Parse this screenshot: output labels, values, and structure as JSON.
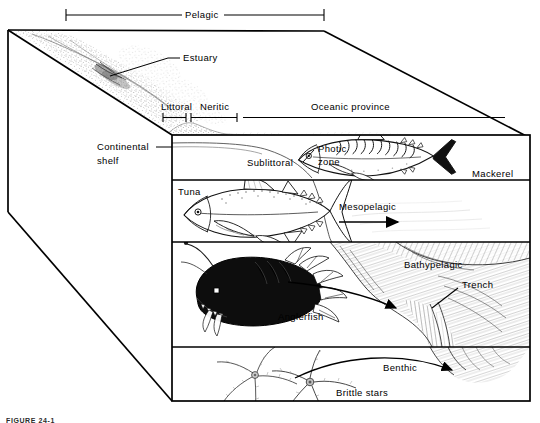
{
  "figure": {
    "caption": "FIGURE 24-1",
    "top_bracket": {
      "label": "Pelagic"
    },
    "surface_labels": [
      {
        "id": "estuary",
        "label": "Estuary"
      },
      {
        "id": "littoral",
        "label": "Littoral"
      },
      {
        "id": "neritic",
        "label": "Neritic"
      },
      {
        "id": "oceanic-province",
        "label": "Oceanic province"
      },
      {
        "id": "continental-shelf-line1",
        "label": "Continental"
      },
      {
        "id": "continental-shelf-line2",
        "label": "shelf"
      },
      {
        "id": "sublittoral",
        "label": "Sublittoral"
      }
    ],
    "zones": [
      {
        "id": "photic",
        "label_line1": "Photic",
        "label_line2": "zone"
      },
      {
        "id": "mesopelagic",
        "label": "Mesopelagic"
      },
      {
        "id": "bathypelagic",
        "label": "Bathypelagic"
      },
      {
        "id": "benthic",
        "label": "Benthic"
      }
    ],
    "organisms": [
      {
        "id": "mackerel",
        "label": "Mackerel"
      },
      {
        "id": "tuna",
        "label": "Tuna"
      },
      {
        "id": "anglerfish",
        "label": "Anglerfish"
      },
      {
        "id": "brittle-stars",
        "label": "Brittle stars"
      }
    ],
    "features": [
      {
        "id": "trench",
        "label": "Trench"
      }
    ]
  }
}
